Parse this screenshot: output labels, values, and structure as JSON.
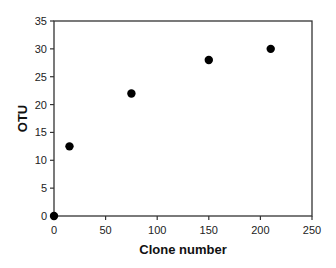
{
  "chart_data": {
    "type": "scatter",
    "title": "",
    "xlabel": "Clone number",
    "ylabel": "OTU",
    "xlim": [
      0,
      250
    ],
    "ylim": [
      0,
      35
    ],
    "x_ticks": [
      0,
      50,
      100,
      150,
      200,
      250
    ],
    "y_ticks": [
      0,
      5,
      10,
      15,
      20,
      25,
      30,
      35
    ],
    "grid": false,
    "legend": null,
    "frame": "box",
    "marker": "filled-circle",
    "marker_color": "#000000",
    "series": [
      {
        "name": "OTU",
        "points": [
          {
            "x": 0,
            "y": 0
          },
          {
            "x": 15,
            "y": 12.5
          },
          {
            "x": 75,
            "y": 22
          },
          {
            "x": 150,
            "y": 28
          },
          {
            "x": 210,
            "y": 30
          }
        ]
      }
    ]
  },
  "layout": {
    "plot_left": 54,
    "plot_right": 312,
    "plot_top": 21,
    "plot_bottom": 216,
    "marker_radius": 4.2
  }
}
